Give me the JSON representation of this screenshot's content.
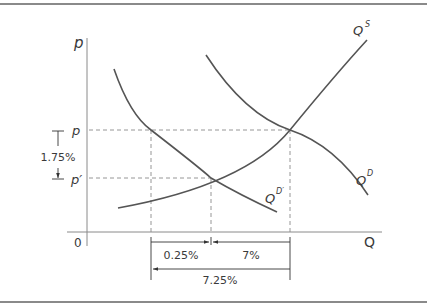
{
  "diagram": {
    "title": "",
    "axes": {
      "y_label": "p",
      "x_label": "Q",
      "origin_label": "0"
    },
    "price_levels": [
      {
        "label": "p",
        "description": "original equilibrium price"
      },
      {
        "label": "p′",
        "description": "new equilibrium price after demand shift"
      }
    ],
    "curves": [
      {
        "id": "supply",
        "label_base": "Q",
        "label_sup": "S"
      },
      {
        "id": "demand",
        "label_base": "Q",
        "label_sup": "D"
      },
      {
        "id": "demand_shifted",
        "label_base": "Q",
        "label_sup": "D′"
      }
    ],
    "annotations": {
      "price_change": "1.75%",
      "quantity_segment_left": "0.25%",
      "quantity_segment_right": "7%",
      "quantity_total": "7.25%"
    },
    "colors": {
      "curves": "#555555",
      "axes": "#8a8a8a",
      "text": "#3a3a3a"
    }
  }
}
